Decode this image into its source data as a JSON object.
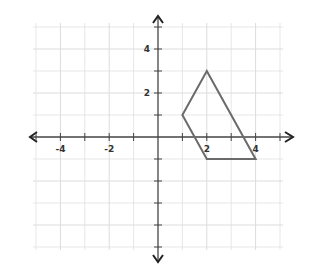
{
  "chart_data": {
    "type": "scatter",
    "title": "",
    "xlabel": "",
    "ylabel": "",
    "xlim": [
      -5,
      5
    ],
    "ylim": [
      -5,
      5
    ],
    "grid": true,
    "x_tick_labels": [
      "-4",
      "-2",
      "2",
      "4"
    ],
    "x_tick_values": [
      -4,
      -2,
      2,
      4
    ],
    "y_tick_labels": [
      "4",
      "2"
    ],
    "y_tick_values": [
      4,
      2
    ],
    "series": [
      {
        "name": "quadrilateral",
        "closed": true,
        "points": [
          {
            "x": 2,
            "y": 3
          },
          {
            "x": 4,
            "y": -1
          },
          {
            "x": 2,
            "y": -1
          },
          {
            "x": 1,
            "y": 1
          }
        ]
      }
    ],
    "legend": null
  },
  "colors": {
    "grid": "#dcdcdc",
    "axis": "#444444",
    "shape": "#6a6a6a",
    "label": "#333333"
  }
}
